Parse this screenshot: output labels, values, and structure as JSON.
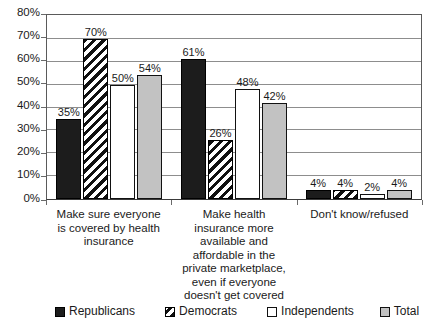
{
  "chart_data": {
    "type": "bar",
    "title": "",
    "subtitle": "",
    "xlabel": "",
    "ylabel": "",
    "ylim": [
      0,
      80
    ],
    "ytick_labels": [
      "80%",
      "70%",
      "60%",
      "50%",
      "40%",
      "30%",
      "20%",
      "10%",
      "0%"
    ],
    "ytick_values": [
      80,
      70,
      60,
      50,
      40,
      30,
      20,
      10,
      0
    ],
    "grid": true,
    "legend_position": "bottom",
    "value_suffix": "%",
    "categories": [
      "Make sure everyone is covered by health insurance",
      "Make health insurance more available and affordable in the private marketplace, even if everyone doesn't get covered",
      "Don't know/refused"
    ],
    "series": [
      {
        "name": "Republicans",
        "fill": "solid-dark",
        "color": "#1c1c1c",
        "values": [
          35,
          61,
          4
        ]
      },
      {
        "name": "Democrats",
        "fill": "hatch",
        "color": "#111111",
        "values": [
          70,
          26,
          4
        ]
      },
      {
        "name": "Independents",
        "fill": "white",
        "color": "#ffffff",
        "values": [
          50,
          48,
          2
        ]
      },
      {
        "name": "Total",
        "fill": "gray",
        "color": "#c2c2c2",
        "values": [
          54,
          42,
          4
        ]
      }
    ],
    "data_labels": [
      [
        "35%",
        "70%",
        "50%",
        "54%"
      ],
      [
        "61%",
        "26%",
        "48%",
        "42%"
      ],
      [
        "4%",
        "4%",
        "2%",
        "4%"
      ]
    ]
  }
}
